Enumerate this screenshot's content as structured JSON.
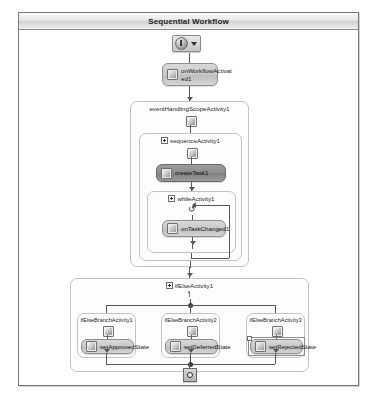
{
  "window": {
    "title": "Sequential Workflow"
  },
  "toolbar": {
    "start_control_name": "workflow-start-dropdown",
    "dropdown_caret": "▼"
  },
  "workflow": {
    "start_node": {
      "label": ""
    },
    "activities": [
      {
        "id": "onWorkflowActivated1",
        "label": "onWorkflowActivat\ned1",
        "icon": "gear-icon",
        "selected": false
      },
      {
        "id": "createTask1",
        "label": "createTask1",
        "icon": "task-icon",
        "selected": true
      },
      {
        "id": "onTaskChanged1",
        "label": "onTaskChanged1",
        "icon": "event-icon",
        "selected": false
      },
      {
        "id": "setApprovedState",
        "label": "setApprovedState",
        "icon": "state-icon",
        "selected": false
      },
      {
        "id": "setDeferredState",
        "label": "setDeferredState",
        "icon": "state-icon",
        "selected": false
      },
      {
        "id": "setRejectedState",
        "label": "setRejectedState",
        "icon": "state-icon",
        "selected": true
      }
    ],
    "containers": [
      {
        "id": "eventHandlingScopeActivity1",
        "label": "eventHandlingScopeActivity1",
        "expander": false
      },
      {
        "id": "sequenceActivity1",
        "label": "sequenceActivity1",
        "expander": true
      },
      {
        "id": "whileActivity1",
        "label": "whileActivity1",
        "expander": true
      },
      {
        "id": "ifElseActivity1",
        "label": "ifElseActivity1",
        "expander": true
      },
      {
        "id": "ifElseBranchActivity1",
        "label": "ifElseBranchActivity1",
        "expander": false
      },
      {
        "id": "ifElseBranchActivity2",
        "label": "ifElseBranchActivity2",
        "expander": false
      },
      {
        "id": "ifElseBranchActivity3",
        "label": "ifElseBranchActivity3",
        "expander": false
      }
    ],
    "end_node": {
      "label": ""
    },
    "loop_glyph": "↺"
  },
  "colors": {
    "frame_border": "#7a7a7a",
    "title_text": "#1d1d1d",
    "connector": "#585858",
    "node_fill": "#c9c9c9",
    "node_selected_fill": "#8d8d8d",
    "container_border": "#c2c2c2"
  }
}
